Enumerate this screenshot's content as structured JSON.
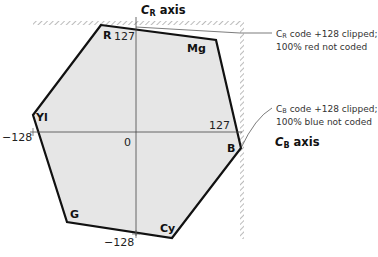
{
  "diagram": {
    "type": "color-difference hexagon",
    "fill_color": "#e6e6e6",
    "edge_color": "#111111",
    "vertices": [
      {
        "name": "R",
        "label": "R"
      },
      {
        "name": "Mg",
        "label": "Mg"
      },
      {
        "name": "B",
        "label": "B"
      },
      {
        "name": "Cy",
        "label": "Cy"
      },
      {
        "name": "G",
        "label": "G"
      },
      {
        "name": "Yl",
        "label": "Yl"
      }
    ],
    "axes": {
      "vertical": {
        "letter": "C",
        "subscript": "R",
        "suffix": " axis"
      },
      "horizontal": {
        "letter": "C",
        "subscript": "B",
        "suffix": " axis"
      }
    },
    "ticks": {
      "origin": "0",
      "cr_max": "127",
      "cr_min": "−128",
      "cb_max": "127",
      "cb_min": "−128"
    },
    "annotations": [
      {
        "letter": "C",
        "subscript": "R",
        "line1_rest": " code +128 clipped;",
        "line2": "100% red not coded"
      },
      {
        "letter": "C",
        "subscript": "B",
        "line1_rest": " code +128 clipped;",
        "line2": "100% blue not coded"
      }
    ]
  }
}
